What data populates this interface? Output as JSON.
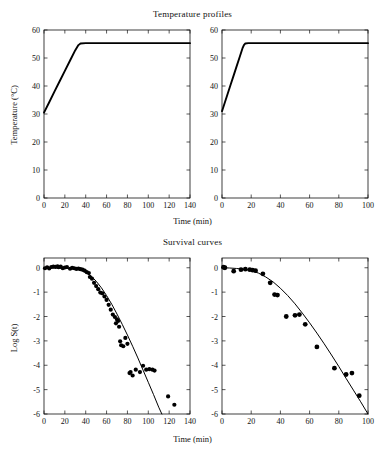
{
  "figure": {
    "titles": {
      "temperature": "Temperature profiles",
      "survival": "Survival curves"
    },
    "axis_labels": {
      "time": "Time (min)",
      "temperature": "Temperature (°C)",
      "log_survival": "Log S(t)"
    }
  },
  "chart_data": [
    {
      "id": "temperature-left",
      "type": "line",
      "title": "Temperature profiles",
      "xlabel": "Time (min)",
      "ylabel": "Temperature (°C)",
      "xlim": [
        0,
        140
      ],
      "ylim": [
        0,
        60
      ],
      "xticks": [
        0,
        20,
        40,
        60,
        80,
        100,
        120,
        140
      ],
      "yticks": [
        0,
        10,
        20,
        30,
        40,
        50,
        60
      ],
      "grid": false,
      "legend": "none",
      "series": [
        {
          "name": "Heating profile (slow come-up)",
          "x": [
            0,
            5,
            10,
            15,
            20,
            25,
            30,
            33,
            35,
            40,
            50,
            60,
            70,
            80,
            90,
            100,
            110,
            120,
            130,
            140
          ],
          "y": [
            30.5,
            34.2,
            38.0,
            41.7,
            45.4,
            49.1,
            52.8,
            54.6,
            55.2,
            55.3,
            55.3,
            55.3,
            55.3,
            55.3,
            55.3,
            55.3,
            55.3,
            55.3,
            55.3,
            55.3
          ]
        }
      ]
    },
    {
      "id": "temperature-right",
      "type": "line",
      "title": "Temperature profiles",
      "xlabel": "Time (min)",
      "ylabel": "Temperature (°C)",
      "xlim": [
        0,
        100
      ],
      "ylim": [
        0,
        60
      ],
      "xticks": [
        0,
        20,
        40,
        60,
        80,
        100
      ],
      "yticks": [
        0,
        10,
        20,
        30,
        40,
        50,
        60
      ],
      "grid": false,
      "legend": "none",
      "series": [
        {
          "name": "Heating profile (fast come-up)",
          "x": [
            0,
            2,
            4,
            6,
            8,
            10,
            12,
            14,
            15,
            16,
            18,
            20,
            30,
            40,
            50,
            60,
            70,
            80,
            90,
            100
          ],
          "y": [
            31.0,
            34.2,
            37.4,
            40.6,
            43.8,
            47.0,
            50.2,
            53.4,
            54.6,
            55.2,
            55.3,
            55.3,
            55.3,
            55.3,
            55.3,
            55.3,
            55.3,
            55.3,
            55.3,
            55.3
          ]
        }
      ]
    },
    {
      "id": "survival-left",
      "type": "scatter",
      "title": "Survival curves",
      "xlabel": "Time (min)",
      "ylabel": "Log S(t)",
      "xlim": [
        0,
        140
      ],
      "ylim": [
        -6,
        0.4
      ],
      "xticks": [
        0,
        20,
        40,
        60,
        80,
        100,
        120,
        140
      ],
      "yticks": [
        0,
        -1,
        -2,
        -3,
        -4,
        -5,
        -6
      ],
      "grid": false,
      "legend": "none",
      "series": [
        {
          "name": "Observed survival ratios",
          "type": "scatter",
          "x": [
            1,
            3,
            5,
            7,
            9,
            11,
            13,
            14,
            16,
            18,
            20,
            22,
            25,
            27,
            29,
            31,
            33,
            35,
            37,
            39,
            41,
            43,
            44,
            46,
            48,
            50,
            52,
            54,
            56,
            58,
            60,
            62,
            64,
            66,
            68,
            69,
            70,
            71,
            72,
            73,
            74,
            76,
            78,
            80,
            82,
            83,
            85,
            88,
            92,
            95,
            98,
            101,
            104,
            106,
            119,
            125
          ],
          "y": [
            -0.02,
            0.02,
            -0.03,
            0.03,
            0.05,
            0.04,
            0.06,
            0.02,
            0.05,
            -0.02,
            0.01,
            0.03,
            -0.04,
            0.0,
            -0.02,
            -0.05,
            -0.03,
            -0.06,
            -0.08,
            -0.12,
            -0.18,
            -0.22,
            -0.38,
            -0.45,
            -0.62,
            -0.75,
            -0.88,
            -1.02,
            -1.05,
            -1.18,
            -1.32,
            -1.52,
            -1.72,
            -1.92,
            -2.02,
            -2.28,
            -2.12,
            -2.18,
            -2.42,
            -3.02,
            -3.18,
            -3.22,
            -2.88,
            -3.12,
            -4.32,
            -4.28,
            -4.42,
            -4.18,
            -4.28,
            -4.02,
            -4.18,
            -4.16,
            -4.18,
            -4.22,
            -5.28,
            -5.62
          ]
        },
        {
          "name": "Fitted survival model",
          "type": "line",
          "x": [
            0,
            10,
            20,
            30,
            35,
            40,
            45,
            50,
            55,
            60,
            65,
            70,
            75,
            80,
            85,
            90,
            95,
            100,
            105,
            110,
            113
          ],
          "y": [
            0.0,
            -0.01,
            -0.02,
            -0.06,
            -0.1,
            -0.18,
            -0.33,
            -0.55,
            -0.82,
            -1.14,
            -1.5,
            -1.9,
            -2.32,
            -2.76,
            -3.22,
            -3.7,
            -4.2,
            -4.7,
            -5.2,
            -5.72,
            -6.0
          ]
        }
      ]
    },
    {
      "id": "survival-right",
      "type": "scatter",
      "title": "Survival curves",
      "xlabel": "Time (min)",
      "ylabel": "Log S(t)",
      "xlim": [
        0,
        100
      ],
      "ylim": [
        -6,
        0.4
      ],
      "xticks": [
        0,
        20,
        40,
        60,
        80,
        100
      ],
      "yticks": [
        0,
        -1,
        -2,
        -3,
        -4,
        -5,
        -6
      ],
      "grid": false,
      "legend": "none",
      "series": [
        {
          "name": "Observed survival ratios",
          "type": "scatter",
          "x": [
            1,
            2,
            8,
            13,
            16,
            19,
            21,
            23,
            28,
            33,
            36,
            38,
            44,
            50,
            53,
            57,
            65,
            77,
            85,
            89,
            94
          ],
          "y": [
            0.02,
            0.0,
            -0.14,
            -0.08,
            -0.06,
            -0.08,
            -0.1,
            -0.12,
            -0.25,
            -0.62,
            -1.1,
            -1.12,
            -2.0,
            -1.95,
            -1.92,
            -2.32,
            -3.25,
            -4.12,
            -4.38,
            -4.32,
            -5.25
          ]
        },
        {
          "name": "Fitted survival model",
          "type": "line",
          "x": [
            0,
            5,
            10,
            15,
            20,
            25,
            30,
            35,
            40,
            45,
            50,
            55,
            60,
            65,
            70,
            75,
            80,
            85,
            90,
            95,
            100
          ],
          "y": [
            0.0,
            -0.01,
            -0.03,
            -0.06,
            -0.12,
            -0.22,
            -0.38,
            -0.58,
            -0.84,
            -1.14,
            -1.48,
            -1.86,
            -2.26,
            -2.68,
            -3.12,
            -3.58,
            -4.05,
            -4.54,
            -5.02,
            -5.5,
            -6.0
          ]
        }
      ]
    }
  ]
}
